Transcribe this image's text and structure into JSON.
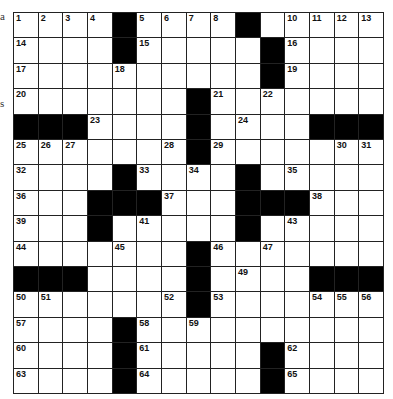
{
  "edge_fragments": [
    "a",
    "s"
  ],
  "puzzle": {
    "rows": 15,
    "cols": 15,
    "layout": [
      "....#....#.....",
      "....#.....#....",
      "..........#....",
      ".......#.......",
      "###....#....###",
      ".......#.......",
      "....#....#.....",
      "...###...###...",
      "...#.....#.....",
      ".......#.......",
      "###....#....###",
      ".......#.......",
      "....#..........",
      "....#.....#....",
      "....#.....#...."
    ],
    "layout_note": "# = black square, . = white square",
    "numbers": {
      "0,0": "1",
      "0,1": "2",
      "0,2": "3",
      "0,3": "4",
      "0,5": "5",
      "0,6": "6",
      "0,7": "7",
      "0,8": "8",
      "0,9": "9",
      "0,11": "10",
      "0,12": "11",
      "0,13": "12",
      "0,14": "13",
      "1,0": "14",
      "1,5": "15",
      "1,11": "16",
      "2,0": "17",
      "2,4": "18",
      "2,11": "19",
      "3,0": "20",
      "3,8": "21",
      "3,10": "22",
      "4,3": "23",
      "4,9": "24",
      "5,0": "25",
      "5,1": "26",
      "5,2": "27",
      "5,6": "28",
      "5,8": "29",
      "5,13": "30",
      "5,14": "31",
      "6,0": "32",
      "6,5": "33",
      "6,7": "34",
      "6,11": "35",
      "7,0": "36",
      "7,6": "37",
      "7,12": "38",
      "8,0": "39",
      "8,3": "40",
      "8,5": "41",
      "8,9": "42",
      "8,11": "43",
      "9,0": "44",
      "9,4": "45",
      "9,8": "46",
      "9,10": "47",
      "10,2": "48",
      "10,9": "49",
      "11,0": "50",
      "11,1": "51",
      "11,6": "52",
      "11,8": "53",
      "11,12": "54",
      "11,13": "55",
      "11,14": "56",
      "12,0": "57",
      "12,5": "58",
      "12,7": "59",
      "13,0": "60",
      "13,5": "61",
      "13,11": "62",
      "14,0": "63",
      "14,5": "64",
      "14,11": "65"
    }
  }
}
